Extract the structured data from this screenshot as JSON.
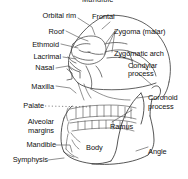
{
  "figure": {
    "title_cropped": "Mandible",
    "background_color": "#ffffff",
    "ink_color": "#1a1a1a",
    "label_color": "#111111"
  },
  "labels": {
    "orbital_rim": "Orbital rim",
    "frontal": "Frontal",
    "roof": "Roof",
    "zygoma_malar": "Zygoma (malar)",
    "ethmoid": "Ethmoid",
    "lacrimal": "Lacrimal",
    "zygomatic_arch": "Zygomatic arch",
    "nasal": "Nasal",
    "condylar": "Condylar",
    "process_top": "process",
    "maxilla": "Maxilla",
    "palate": "Palate",
    "coronoid": "Coronoid",
    "process_bottom": "process",
    "alveolar": "Alveolar",
    "margins": "margins",
    "ramus": "Ramus",
    "mandible": "Mandible",
    "body": "Body",
    "angle": "Angle",
    "symphysis": "Symphysis"
  }
}
